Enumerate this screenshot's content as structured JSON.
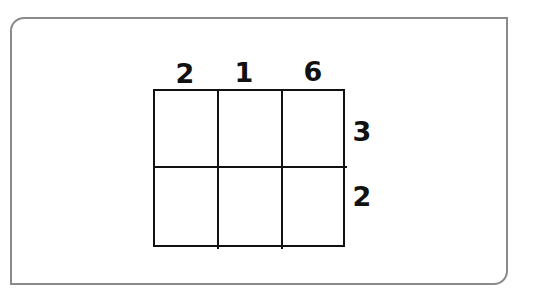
{
  "diagram": {
    "type": "multiplication-grid",
    "top_factor_digits": [
      "2",
      "1",
      "6"
    ],
    "side_factor_digits": [
      "3",
      "2"
    ],
    "rows": 2,
    "columns": 3,
    "cells": [
      [
        "",
        "",
        ""
      ],
      [
        "",
        "",
        ""
      ]
    ]
  }
}
